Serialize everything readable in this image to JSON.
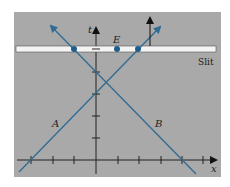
{
  "diagram": {
    "background_color": "#a9a9a9",
    "line_color": "#2f6b93",
    "slit_color": "#f4f4f4",
    "labels": {
      "t_axis": "t",
      "x_axis": "x",
      "event": "E",
      "slit": "Slit",
      "line_a": "A",
      "line_b": "B"
    },
    "x_ticks": 9,
    "t_ticks": 4,
    "dots_on_slit": 3
  }
}
